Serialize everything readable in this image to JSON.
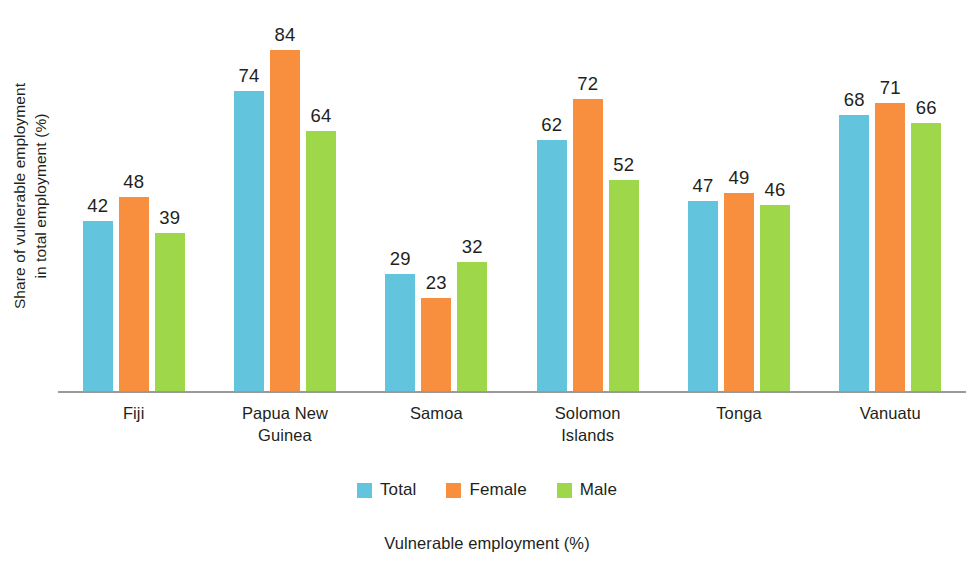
{
  "chart_data": {
    "type": "bar",
    "title": "",
    "caption": "Vulnerable employment (%)",
    "xlabel": "",
    "ylabel": "Share of vulnerable employment in total employment (%)",
    "ylabel_line1": "Share of vulnerable employment",
    "ylabel_line2": "in total employment (%)",
    "ylim": [
      0,
      96
    ],
    "grid": false,
    "legend_position": "bottom-center",
    "value_labels": true,
    "categories": [
      "Fiji",
      "Papua New Guinea",
      "Samoa",
      "Solomon Islands",
      "Tonga",
      "Vanuatu"
    ],
    "category_lines": [
      [
        "Fiji"
      ],
      [
        "Papua New",
        "Guinea"
      ],
      [
        "Samoa"
      ],
      [
        "Solomon",
        "Islands"
      ],
      [
        "Tonga"
      ],
      [
        "Vanuatu"
      ]
    ],
    "series": [
      {
        "name": "Total",
        "color": "#62c5dd",
        "values": [
          42,
          74,
          29,
          62,
          47,
          68
        ]
      },
      {
        "name": "Female",
        "color": "#f78f3f",
        "values": [
          48,
          84,
          23,
          72,
          49,
          71
        ]
      },
      {
        "name": "Male",
        "color": "#9ed84a",
        "values": [
          39,
          64,
          32,
          52,
          46,
          66
        ]
      }
    ]
  },
  "colors": {
    "total": "#62c5dd",
    "female": "#f78f3f",
    "male": "#9ed84a",
    "axis": "#9a9a9a",
    "text": "#231f20",
    "background": "#ffffff"
  },
  "legend": {
    "items": [
      {
        "label": "Total",
        "color": "#62c5dd"
      },
      {
        "label": "Female",
        "color": "#f78f3f"
      },
      {
        "label": "Male",
        "color": "#9ed84a"
      }
    ]
  }
}
